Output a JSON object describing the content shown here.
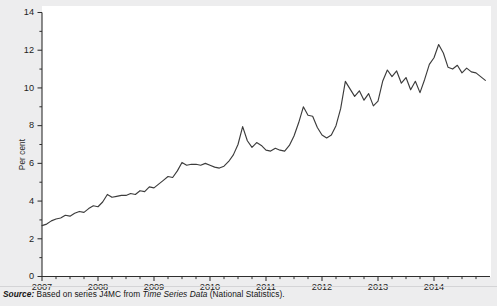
{
  "figure": {
    "background_color": "#ededee",
    "plot_background_color": "#ffffff",
    "line_color": "#3c3c3c",
    "axis_color": "#2e2e2e"
  },
  "source": {
    "label": "Source:",
    "text_before": " Based on series J4MC from ",
    "italic_title": "Time Series Data",
    "text_after": " (National Statistics)."
  },
  "chart_data": {
    "type": "line",
    "title": "",
    "subtitle": "",
    "xlabel": "",
    "ylabel": "Per cent",
    "ylim": [
      0,
      14
    ],
    "xlim": [
      2007.0,
      2015.0
    ],
    "grid": false,
    "legend": false,
    "legend_position": "none",
    "ytick_labels": [
      "0",
      "2",
      "4",
      "6",
      "8",
      "10",
      "12",
      "14"
    ],
    "ytick_values": [
      0,
      2,
      4,
      6,
      8,
      10,
      12,
      14
    ],
    "yminor_tick_values": [
      1,
      3,
      5,
      7,
      9,
      11,
      13
    ],
    "xtick_labels": [
      "2007",
      "2008",
      "2009",
      "2010",
      "2011",
      "2012",
      "2013",
      "2014"
    ],
    "xtick_values": [
      2007,
      2008,
      2009,
      2010,
      2011,
      2012,
      2013,
      2014
    ],
    "xminor_interval_years": 0.25,
    "series": [
      {
        "name": "J4MC",
        "x": [
          2007.0,
          2007.083,
          2007.167,
          2007.25,
          2007.333,
          2007.417,
          2007.5,
          2007.583,
          2007.667,
          2007.75,
          2007.833,
          2007.917,
          2008.0,
          2008.083,
          2008.167,
          2008.25,
          2008.333,
          2008.417,
          2008.5,
          2008.583,
          2008.667,
          2008.75,
          2008.833,
          2008.917,
          2009.0,
          2009.083,
          2009.167,
          2009.25,
          2009.333,
          2009.417,
          2009.5,
          2009.583,
          2009.667,
          2009.75,
          2009.833,
          2009.917,
          2010.0,
          2010.083,
          2010.167,
          2010.25,
          2010.333,
          2010.417,
          2010.5,
          2010.583,
          2010.667,
          2010.75,
          2010.833,
          2010.917,
          2011.0,
          2011.083,
          2011.167,
          2011.25,
          2011.333,
          2011.417,
          2011.5,
          2011.583,
          2011.667,
          2011.75,
          2011.833,
          2011.917,
          2012.0,
          2012.083,
          2012.167,
          2012.25,
          2012.333,
          2012.417,
          2012.5,
          2012.583,
          2012.667,
          2012.75,
          2012.833,
          2012.917,
          2013.0,
          2013.083,
          2013.167,
          2013.25,
          2013.333,
          2013.417,
          2013.5,
          2013.583,
          2013.667,
          2013.75,
          2013.833,
          2013.917,
          2014.0,
          2014.083,
          2014.167,
          2014.25,
          2014.333,
          2014.417,
          2014.5,
          2014.583,
          2014.667,
          2014.75,
          2014.833,
          2014.917
        ],
        "values": [
          2.7,
          2.78,
          2.95,
          3.05,
          3.1,
          3.25,
          3.2,
          3.35,
          3.45,
          3.4,
          3.6,
          3.75,
          3.7,
          3.95,
          4.35,
          4.2,
          4.25,
          4.3,
          4.3,
          4.4,
          4.35,
          4.55,
          4.5,
          4.75,
          4.7,
          4.9,
          5.1,
          5.3,
          5.25,
          5.6,
          6.05,
          5.9,
          5.95,
          5.95,
          5.9,
          6.0,
          5.9,
          5.8,
          5.75,
          5.85,
          6.1,
          6.45,
          7.0,
          7.95,
          7.2,
          6.85,
          7.1,
          6.95,
          6.7,
          6.65,
          6.8,
          6.7,
          6.65,
          6.95,
          7.45,
          8.15,
          9.0,
          8.55,
          8.5,
          7.9,
          7.5,
          7.35,
          7.5,
          8.0,
          8.9,
          10.35,
          9.95,
          9.55,
          9.85,
          9.35,
          9.7,
          9.05,
          9.3,
          10.35,
          10.95,
          10.6,
          10.9,
          10.25,
          10.55,
          9.9,
          10.35,
          9.75,
          10.45,
          11.25,
          11.6,
          12.3,
          11.85,
          11.1,
          11.0,
          11.2,
          10.8,
          11.05,
          10.85,
          10.8,
          10.6,
          10.4
        ]
      }
    ]
  }
}
